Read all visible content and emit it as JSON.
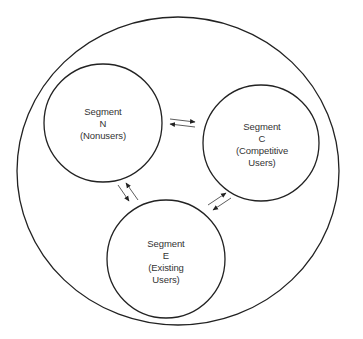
{
  "diagram": {
    "type": "market-segment-flow",
    "colors": {
      "stroke": "#222222",
      "text": "#333333",
      "background": "#ffffff"
    },
    "outer_boundary": {
      "label": "",
      "cx": 178,
      "cy": 171,
      "rx": 161,
      "ry": 154
    },
    "segments": [
      {
        "id": "N",
        "title": "Segment",
        "letter": "N",
        "description": "(Nonusers)",
        "description_line2": "",
        "cx": 103,
        "cy": 123,
        "r": 59
      },
      {
        "id": "C",
        "title": "Segment",
        "letter": "C",
        "description": "(Competitive",
        "description_line2": "Users)",
        "cx": 261,
        "cy": 143,
        "r": 58
      },
      {
        "id": "E",
        "title": "Segment",
        "letter": "E",
        "description": "(Existing",
        "description_line2": "Users)",
        "cx": 166,
        "cy": 259,
        "r": 59
      }
    ],
    "flows": [
      {
        "from": "N",
        "to": "C",
        "direction": "bidirectional"
      },
      {
        "from": "N",
        "to": "E",
        "direction": "bidirectional"
      },
      {
        "from": "E",
        "to": "C",
        "direction": "bidirectional"
      }
    ]
  }
}
